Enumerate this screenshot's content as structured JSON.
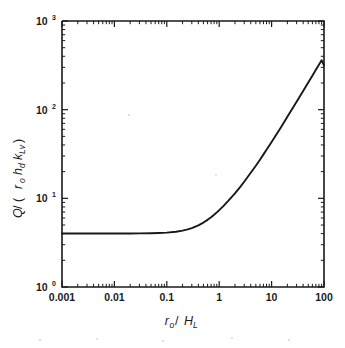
{
  "chart_data": {
    "type": "line",
    "title": "",
    "subtitle": "",
    "xlabel": "r_o / H_L",
    "xlabel_parts": {
      "var1": "r",
      "var1_sub": "o",
      "separator": " / ",
      "var2": "H",
      "var2_sub": "L"
    },
    "ylabel": "Q / (r_o h_d k_Lv)",
    "ylabel_parts": {
      "numerator": "Q",
      "separator": " / (",
      "var1": "r",
      "var1_sub": "o",
      "var2": "h",
      "var2_sub": "d",
      "var3": "k",
      "var3_sub": "Lv",
      "close": ")"
    },
    "xscale": "log",
    "yscale": "log",
    "xlim": [
      0.001,
      100
    ],
    "ylim": [
      1,
      1000
    ],
    "xtick_labels": [
      "0.001",
      "0.01",
      "0.1",
      "1",
      "10",
      "100"
    ],
    "xtick_values": [
      0.001,
      0.01,
      0.1,
      1,
      10,
      100
    ],
    "ytick_labels": [
      "10⁰",
      "10¹",
      "10²",
      "10³"
    ],
    "ytick_bases": [
      "10",
      "10",
      "10",
      "10"
    ],
    "ytick_exponents": [
      "0",
      "1",
      "2",
      "3"
    ],
    "ytick_values": [
      1,
      10,
      100,
      1000
    ],
    "grid": false,
    "legend": null,
    "legend_position": "none",
    "minor_ticks": true,
    "tick_direction": "in",
    "line_color": "#191919",
    "background_color": "#ffffff",
    "frame_color": "#1a1a1a",
    "annotations": [],
    "series": [
      {
        "name": "Q/(r_o h_d k_Lv)",
        "color": "#191919",
        "x": [
          0.001,
          0.0015,
          0.002,
          0.003,
          0.005,
          0.007,
          0.01,
          0.015,
          0.02,
          0.03,
          0.05,
          0.07,
          0.1,
          0.15,
          0.2,
          0.25,
          0.3,
          0.4,
          0.5,
          0.6,
          0.7,
          0.8,
          0.9,
          1.0,
          1.2,
          1.5,
          2.0,
          2.5,
          3.0,
          4.0,
          5.0,
          6.0,
          7.0,
          8.0,
          10.0,
          12.0,
          15.0,
          20.0,
          25.0,
          30.0,
          40.0,
          50.0,
          60.0,
          70.0,
          80.0,
          90.0,
          100.0
        ],
        "y": [
          4.02,
          4.02,
          4.02,
          4.02,
          4.02,
          4.02,
          4.02,
          4.02,
          4.02,
          4.03,
          4.04,
          4.06,
          4.1,
          4.2,
          4.32,
          4.46,
          4.62,
          4.96,
          5.33,
          5.72,
          6.12,
          6.53,
          6.94,
          7.35,
          8.18,
          9.4,
          11.4,
          13.4,
          15.4,
          19.4,
          23.3,
          27.3,
          31.3,
          35.3,
          43.2,
          51.2,
          63.1,
          83.0,
          103,
          123,
          162,
          202,
          242,
          282,
          321,
          361,
          317
        ],
        "asymptote_low": 4.02,
        "asymptote_high_slope": 1.0,
        "endpoint_value": 317
      }
    ]
  },
  "figure": {
    "plot_area": {
      "left": 62,
      "top": 21,
      "right": 324,
      "bottom": 287
    }
  }
}
